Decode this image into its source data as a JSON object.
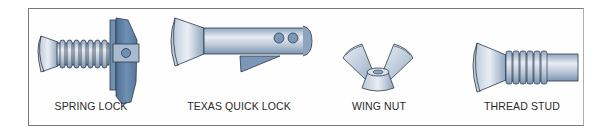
{
  "figure": {
    "items": [
      {
        "label": "SPRING LOCK",
        "icon": "spring-lock-fastener"
      },
      {
        "label": "TEXAS QUICK LOCK",
        "icon": "texas-quick-lock-fastener"
      },
      {
        "label": "WING NUT",
        "icon": "wing-nut"
      },
      {
        "label": "THREAD STUD",
        "icon": "thread-stud"
      }
    ],
    "colors": {
      "metal_light": "#d8e0ea",
      "metal_mid": "#9fb2c8",
      "metal_dark": "#5f7fa3",
      "outline": "#2d3a4a",
      "frame": "#7a7a7a"
    }
  }
}
